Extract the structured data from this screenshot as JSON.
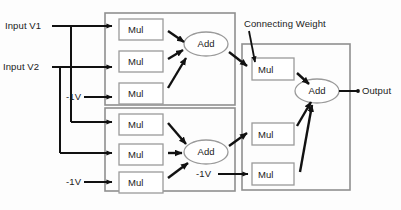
{
  "diagram": {
    "colors": {
      "container_stroke": "#8f8f8f",
      "node_stroke": "#9a9a9a",
      "wire": "#111111",
      "text": "#1a1a1a",
      "background": "#fdfdfd"
    },
    "labels": {
      "input_v1": "Input V1",
      "input_v2": "Input V2",
      "bias_top": "-1V",
      "bias_bottom": "-1V",
      "bias_right": "-1V",
      "connecting_weight": "Connecting Weight",
      "output": "Output"
    },
    "containers": [
      {
        "name": "hidden-layer-neuron-1",
        "x": 105,
        "y": 13,
        "w": 130,
        "h": 92
      },
      {
        "name": "hidden-layer-neuron-2",
        "x": 105,
        "y": 108,
        "w": 130,
        "h": 83
      },
      {
        "name": "output-layer-neuron",
        "x": 242,
        "y": 44,
        "w": 108,
        "h": 146
      }
    ],
    "mul_nodes": [
      {
        "id": "mul-1",
        "label": "Mul",
        "x": 119,
        "y": 19,
        "w": 44,
        "h": 21
      },
      {
        "id": "mul-2",
        "label": "Mul",
        "x": 119,
        "y": 51,
        "w": 44,
        "h": 21
      },
      {
        "id": "mul-3",
        "label": "Mul",
        "x": 119,
        "y": 83,
        "w": 44,
        "h": 21
      },
      {
        "id": "mul-4",
        "label": "Mul",
        "x": 119,
        "y": 114,
        "w": 44,
        "h": 21
      },
      {
        "id": "mul-5",
        "label": "Mul",
        "x": 119,
        "y": 144,
        "w": 44,
        "h": 21
      },
      {
        "id": "mul-6",
        "label": "Mul",
        "x": 119,
        "y": 172,
        "w": 44,
        "h": 21
      },
      {
        "id": "mul-7",
        "label": "Mul",
        "x": 252,
        "y": 58,
        "w": 42,
        "h": 22
      },
      {
        "id": "mul-8",
        "label": "Mul",
        "x": 252,
        "y": 123,
        "w": 42,
        "h": 22
      },
      {
        "id": "mul-9",
        "label": "Mul",
        "x": 252,
        "y": 163,
        "w": 42,
        "h": 22
      }
    ],
    "add_nodes": [
      {
        "id": "add-1",
        "label": "Add",
        "cx": 206,
        "cy": 44,
        "rx": 22,
        "ry": 12
      },
      {
        "id": "add-2",
        "label": "Add",
        "cx": 206,
        "cy": 152,
        "rx": 22,
        "ry": 12
      },
      {
        "id": "add-3",
        "label": "Add",
        "cx": 317,
        "cy": 91,
        "rx": 22,
        "ry": 12
      }
    ],
    "signal_flow": [
      {
        "from": "Input V1",
        "to": "mul-1"
      },
      {
        "from": "Input V2",
        "to": "mul-2"
      },
      {
        "from": "-1V (top)",
        "to": "mul-3"
      },
      {
        "from": "Input V1",
        "to": "mul-4"
      },
      {
        "from": "Input V2",
        "to": "mul-5"
      },
      {
        "from": "-1V (bottom)",
        "to": "mul-6"
      },
      {
        "from": "mul-1",
        "to": "add-1"
      },
      {
        "from": "mul-2",
        "to": "add-1"
      },
      {
        "from": "mul-3",
        "to": "add-1"
      },
      {
        "from": "mul-4",
        "to": "add-2"
      },
      {
        "from": "mul-5",
        "to": "add-2"
      },
      {
        "from": "mul-6",
        "to": "add-2"
      },
      {
        "from": "add-1",
        "to": "mul-7"
      },
      {
        "from": "add-2",
        "to": "mul-8"
      },
      {
        "from": "-1V (right)",
        "to": "mul-9"
      },
      {
        "from": "mul-7",
        "to": "add-3"
      },
      {
        "from": "mul-8",
        "to": "add-3"
      },
      {
        "from": "mul-9",
        "to": "add-3"
      },
      {
        "from": "add-3",
        "to": "Output"
      },
      {
        "from": "Connecting Weight",
        "to": "mul-7"
      }
    ]
  }
}
